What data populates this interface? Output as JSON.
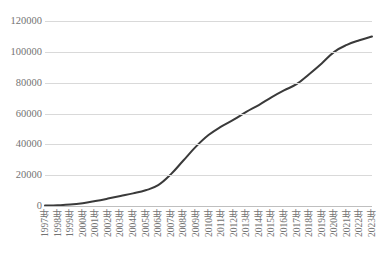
{
  "chart_data": {
    "type": "line",
    "title": "",
    "subtitle": "",
    "xlabel": "",
    "ylabel": "",
    "categories": [
      "1997年",
      "1998年",
      "1999年",
      "2000年",
      "2001年",
      "2002年",
      "2003年",
      "2004年",
      "2005年",
      "2006年",
      "2007年",
      "2008年",
      "2009年",
      "2010年",
      "2011年",
      "2012年",
      "2013年",
      "2014年",
      "2015年",
      "2016年",
      "2017年",
      "2018年",
      "2019年",
      "2020年",
      "2021年",
      "2022年",
      "2023年"
    ],
    "values": [
      300,
      500,
      900,
      1800,
      3200,
      4800,
      6500,
      8200,
      10200,
      13500,
      20500,
      29500,
      38500,
      46000,
      51500,
      56000,
      61000,
      65500,
      70500,
      75000,
      79000,
      85500,
      92500,
      100000,
      104500,
      107500,
      110000
    ],
    "ylim": [
      0,
      120000
    ],
    "ytick_labels": [
      "0",
      "20000",
      "40000",
      "60000",
      "80000",
      "100000",
      "120000"
    ],
    "ytick_values": [
      0,
      20000,
      40000,
      60000,
      80000,
      100000,
      120000
    ],
    "grid": true,
    "grid_axis": "y",
    "legend": false,
    "legend_position": "none",
    "series": [
      {
        "name": "",
        "color": "#3a3a3a",
        "values": [
          300,
          500,
          900,
          1800,
          3200,
          4800,
          6500,
          8200,
          10200,
          13500,
          20500,
          29500,
          38500,
          46000,
          51500,
          56000,
          61000,
          65500,
          70500,
          75000,
          79000,
          85500,
          92500,
          100000,
          104500,
          107500,
          110000
        ]
      }
    ],
    "annotations": []
  },
  "style": {
    "line_color": "#3a3a3a",
    "grid_color": "#d9d9d9",
    "axis_color": "#bfbfbf",
    "label_color": "#737373",
    "background": "#ffffff"
  }
}
